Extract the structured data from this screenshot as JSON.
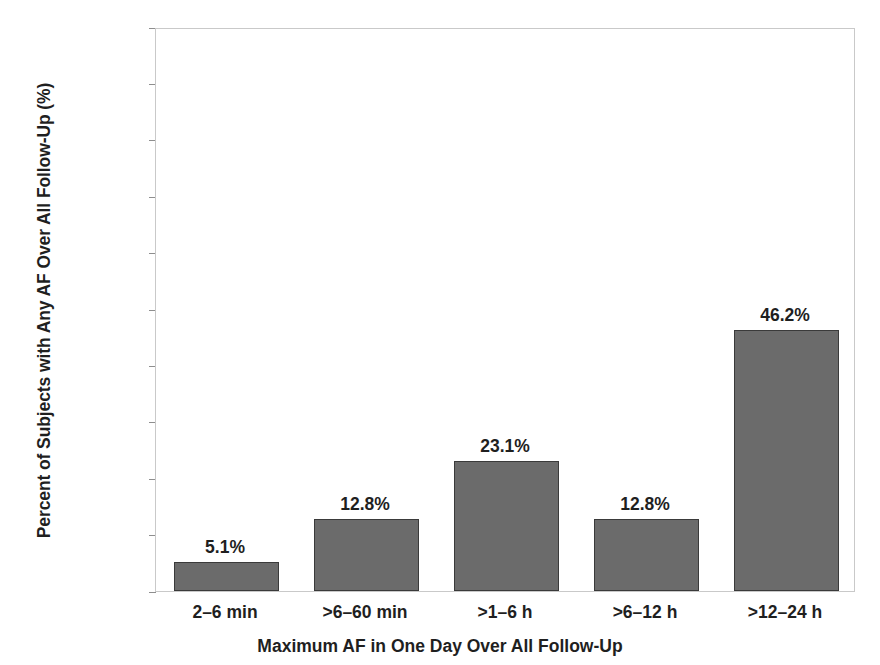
{
  "chart_data": {
    "type": "bar",
    "title": "",
    "subtitle": "",
    "xlabel": "Maximum AF in One Day Over All Follow-Up",
    "ylabel": "Percent of Subjects with Any AF Over All Follow-Up (%)",
    "categories": [
      "2–6 min",
      ">6–60 min",
      ">1–6 h",
      ">6–12 h",
      ">12–24 h"
    ],
    "values": [
      5.1,
      12.8,
      23.1,
      12.8,
      46.2
    ],
    "value_labels": [
      "5.1%",
      "12.8%",
      "23.1%",
      "12.8%",
      "46.2%"
    ],
    "ylim": [
      0,
      100
    ],
    "ytick_values": [
      0,
      10,
      20,
      30,
      40,
      50,
      60,
      70,
      80,
      90,
      100
    ],
    "ytick_labels": [
      "0.0%",
      "10.0%",
      "20.0%",
      "30.0%",
      "40.0%",
      "50.0%",
      "60.0%",
      "70.0%",
      "80.0%",
      "90.0%",
      "100.0%"
    ],
    "grid": false,
    "legend": false,
    "legend_position": "none",
    "bar_color": "#6b6b6b",
    "bar_edge_color": "#3a3a3a",
    "frame_color": "#c9c9c9",
    "background_color": "#ffffff",
    "text_color": "#1f1f1f"
  }
}
